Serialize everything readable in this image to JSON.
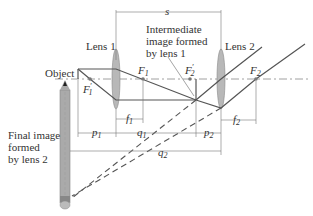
{
  "diagram": {
    "type": "two-lens optical system",
    "labels": {
      "object": "Object",
      "lens1": "Lens 1",
      "lens2": "Lens 2",
      "intermediate_line1": "Intermediate",
      "intermediate_line2": "image formed",
      "intermediate_line3": "by lens 1",
      "final_line1": "Final image",
      "final_line2": "formed",
      "final_line3": "by lens 2",
      "s": "s",
      "F1": "F",
      "F1_sub": "1",
      "F1p": "F",
      "F1p_sub": "1",
      "F2": "F",
      "F2_sub": "2",
      "F2p": "F",
      "F2p_sub": "2",
      "f1": "f",
      "f1_sub": "1",
      "f2": "f",
      "f2_sub": "2",
      "p1": "p",
      "p1_sub": "1",
      "q1": "q",
      "q1_sub": "1",
      "p2": "p",
      "p2_sub": "2",
      "q2": "q",
      "q2_sub": "2",
      "prime": "′"
    },
    "colors": {
      "ray": "#555555",
      "lens_fill": "#b8b8b8",
      "dim_line": "#777777",
      "text": "#333333"
    }
  }
}
